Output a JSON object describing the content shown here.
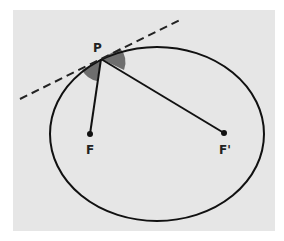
{
  "diagram": {
    "colors": {
      "background": "#ffffff",
      "panel": "#e6e6e6",
      "stroke": "#111111",
      "angle_fill": "#6e6e6e"
    },
    "labels": {
      "point": "P",
      "focus1": "F",
      "focus2": "F'"
    },
    "elements": [
      {
        "type": "ellipse",
        "name": "ellipse"
      },
      {
        "type": "dashed-line",
        "name": "tangent-line"
      },
      {
        "type": "segment",
        "from": "P",
        "to": "F"
      },
      {
        "type": "segment",
        "from": "P",
        "to": "F'"
      },
      {
        "type": "angle-wedge",
        "side": "left"
      },
      {
        "type": "angle-wedge",
        "side": "right"
      },
      {
        "type": "point",
        "label": "F"
      },
      {
        "type": "point",
        "label": "F'"
      }
    ]
  }
}
